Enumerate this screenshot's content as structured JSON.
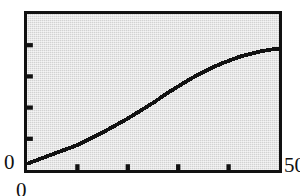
{
  "chart_data": {
    "type": "line",
    "title": "",
    "subtitle": "",
    "xlabel": "",
    "ylabel": "",
    "grid": false,
    "legend": null,
    "legend_position": "none",
    "xlim": [
      0,
      50
    ],
    "ylim": [
      0,
      50
    ],
    "xticks": [
      0,
      10,
      20,
      30,
      40,
      50
    ],
    "yticks": [
      0,
      10,
      20,
      30,
      40,
      50
    ],
    "xtick_labels": [
      "0",
      "",
      "",
      "",
      "",
      "50"
    ],
    "ytick_labels": [
      "0",
      "",
      "",
      "",
      "",
      "50"
    ],
    "series": [
      {
        "name": "curve",
        "color": "#111111",
        "x": [
          0,
          1,
          2,
          3,
          4,
          5,
          6,
          7,
          8,
          9,
          10,
          11,
          12,
          13,
          14,
          15,
          16,
          17,
          18,
          19,
          20,
          21,
          22,
          23,
          24,
          25,
          26,
          27,
          28,
          29,
          30,
          31,
          32,
          33,
          34,
          35,
          36,
          37,
          38,
          39,
          40,
          41,
          42,
          43,
          44,
          45,
          46,
          47,
          48,
          49,
          50
        ],
        "y": [
          2.0,
          2.6,
          3.2,
          3.8,
          4.4,
          5.0,
          5.6,
          6.2,
          6.8,
          7.4,
          8.0,
          8.8,
          9.6,
          10.4,
          11.2,
          12.0,
          12.9,
          13.8,
          14.7,
          15.6,
          16.5,
          17.5,
          18.5,
          19.5,
          20.5,
          21.5,
          22.6,
          23.7,
          24.8,
          25.8,
          26.8,
          27.8,
          28.8,
          29.7,
          30.6,
          31.4,
          32.2,
          33.0,
          33.7,
          34.4,
          35.0,
          35.6,
          36.2,
          36.7,
          37.1,
          37.5,
          37.9,
          38.2,
          38.5,
          38.7,
          38.9
        ]
      }
    ]
  },
  "axes": {
    "y_top_label": "50",
    "y_bottom_label": "0",
    "x_left_label": "0",
    "x_right_label": "50"
  },
  "style": {
    "frame_color": "#111111",
    "panel_color": "#d2d2d2",
    "line_color": "#111111",
    "page_background": "#ffffff"
  }
}
